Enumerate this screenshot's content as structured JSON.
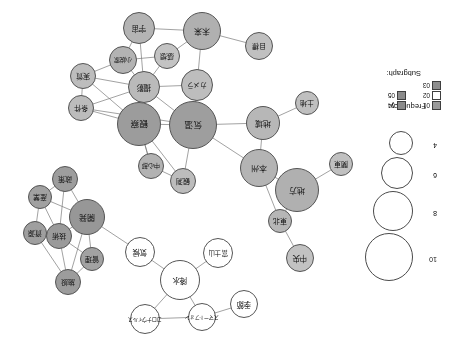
{
  "figure": {
    "type": "co-occurrence-network",
    "orientation_degrees": 180,
    "background": "#ffffff"
  },
  "legend": {
    "frequency": {
      "title": "Frequency:",
      "values": [
        4,
        6,
        8,
        10
      ],
      "radii_px": [
        11,
        15,
        19,
        23
      ]
    },
    "subgraph": {
      "title": "Subgraph:",
      "items": [
        {
          "id": "01",
          "color": "#9a9a9a"
        },
        {
          "id": "02",
          "color": "#ffffff"
        },
        {
          "id": "03",
          "color": "#8e8e8e"
        },
        {
          "id": "04",
          "color": "#8b8b8b"
        },
        {
          "id": "05",
          "color": "#8b8b8b"
        },
        {
          "id": "06",
          "color": "#9a9a9a"
        }
      ]
    }
  },
  "chart_data": {
    "type": "network",
    "title": "",
    "nodes": [
      {
        "id": "n_kisetsu",
        "label": "季節",
        "x": 211,
        "y": 49,
        "r": 14,
        "fill": "#ffffff",
        "font": 7.5
      },
      {
        "id": "n_smartphone",
        "label": "スマートフォン",
        "x": 253,
        "y": 36,
        "r": 14,
        "fill": "#ffffff",
        "font": 5.2
      },
      {
        "id": "n_coronavirus",
        "label": "コロナウイルス",
        "x": 310,
        "y": 34,
        "r": 15,
        "fill": "#ffffff",
        "font": 5.2
      },
      {
        "id": "n_kousui",
        "label": "降水",
        "x": 275,
        "y": 73,
        "r": 20,
        "fill": "#ffffff",
        "font": 7.5
      },
      {
        "id": "n_fuji",
        "label": "富士山",
        "x": 237,
        "y": 100,
        "r": 15,
        "fill": "#ffffff",
        "font": 6.5
      },
      {
        "id": "n_kikou",
        "label": "気候",
        "x": 315,
        "y": 101,
        "r": 15,
        "fill": "#ffffff",
        "font": 7.5
      },
      {
        "id": "n_chuuou",
        "label": "中央",
        "x": 155,
        "y": 95,
        "r": 14,
        "fill": "#c2c2c2",
        "font": 7.5
      },
      {
        "id": "n_touhoku",
        "label": "東北",
        "x": 175,
        "y": 132,
        "r": 12,
        "fill": "#b6b6b6",
        "font": 7
      },
      {
        "id": "n_chihou",
        "label": "地方",
        "x": 158,
        "y": 163,
        "r": 22,
        "fill": "#b0b0b0",
        "font": 8
      },
      {
        "id": "n_kanto",
        "label": "関東",
        "x": 114,
        "y": 189,
        "r": 12,
        "fill": "#c0c0c0",
        "font": 7
      },
      {
        "id": "n_honshu",
        "label": "本州",
        "x": 196,
        "y": 185,
        "r": 19,
        "fill": "#b4b4b4",
        "font": 8
      },
      {
        "id": "n_chiiki",
        "label": "地域",
        "x": 192,
        "y": 230,
        "r": 17,
        "fill": "#b7b7b7",
        "font": 8
      },
      {
        "id": "n_tochi",
        "label": "土地",
        "x": 148,
        "y": 250,
        "r": 12,
        "fill": "#bfbfbf",
        "font": 7
      },
      {
        "id": "n_kansoku",
        "label": "観測",
        "x": 272,
        "y": 172,
        "r": 13,
        "fill": "#bcbcbc",
        "font": 7
      },
      {
        "id": "n_chuushin",
        "label": "中心部",
        "x": 304,
        "y": 187,
        "r": 13,
        "fill": "#b2b2b2",
        "font": 6.2
      },
      {
        "id": "n_kion",
        "label": "気温",
        "x": 262,
        "y": 228,
        "r": 24,
        "fill": "#9e9e9e",
        "font": 8.5
      },
      {
        "id": "n_kansatsu",
        "label": "観察",
        "x": 316,
        "y": 229,
        "r": 22,
        "fill": "#9c9c9c",
        "font": 8.5
      },
      {
        "id": "n_kamera",
        "label": "カメラ",
        "x": 258,
        "y": 268,
        "r": 16,
        "fill": "#bdbdbd",
        "font": 6.8
      },
      {
        "id": "n_satsuei",
        "label": "撮影",
        "x": 311,
        "y": 266,
        "r": 16,
        "fill": "#bababa",
        "font": 7.5
      },
      {
        "id": "n_kansou",
        "label": "感想",
        "x": 288,
        "y": 297,
        "r": 13,
        "fill": "#c3c3c3",
        "font": 7
      },
      {
        "id": "n_shousetsu",
        "label": "小説家",
        "x": 332,
        "y": 293,
        "r": 14,
        "fill": "#b3b3b3",
        "font": 6.2
      },
      {
        "id": "n_jouken",
        "label": "条件",
        "x": 374,
        "y": 245,
        "r": 13,
        "fill": "#bcbcbc",
        "font": 7
      },
      {
        "id": "n_jisshitsu",
        "label": "実質",
        "x": 372,
        "y": 277,
        "r": 13,
        "fill": "#bdbdbd",
        "font": 7
      },
      {
        "id": "n_uchuu",
        "label": "宇宙",
        "x": 316,
        "y": 325,
        "r": 16,
        "fill": "#b4b4b4",
        "font": 7.5
      },
      {
        "id": "n_mirai",
        "label": "未来",
        "x": 253,
        "y": 322,
        "r": 19,
        "fill": "#b0b0b0",
        "font": 8
      },
      {
        "id": "n_mokuhyou",
        "label": "目標",
        "x": 196,
        "y": 307,
        "r": 14,
        "fill": "#c0c0c0",
        "font": 6.8
      },
      {
        "id": "n_shisetsu",
        "label": "施設",
        "x": 387,
        "y": 71,
        "r": 13,
        "fill": "#9c9c9c",
        "font": 7
      },
      {
        "id": "n_kanri",
        "label": "管理",
        "x": 363,
        "y": 94,
        "r": 12,
        "fill": "#a2a2a2",
        "font": 7
      },
      {
        "id": "n_gijutsu",
        "label": "技術",
        "x": 396,
        "y": 117,
        "r": 13,
        "fill": "#9a9a9a",
        "font": 7
      },
      {
        "id": "n_shigen",
        "label": "資源",
        "x": 420,
        "y": 120,
        "r": 12,
        "fill": "#9f9f9f",
        "font": 7
      },
      {
        "id": "n_kaihatsu",
        "label": "開発",
        "x": 368,
        "y": 136,
        "r": 18,
        "fill": "#979797",
        "font": 8
      },
      {
        "id": "n_sangyou",
        "label": "産業",
        "x": 415,
        "y": 156,
        "r": 12,
        "fill": "#a1a1a1",
        "font": 7
      },
      {
        "id": "n_seisaku",
        "label": "政策",
        "x": 390,
        "y": 174,
        "r": 13,
        "fill": "#9d9d9d",
        "font": 7
      }
    ],
    "edges": [
      [
        "n_kisetsu",
        "n_smartphone"
      ],
      [
        "n_smartphone",
        "n_coronavirus"
      ],
      [
        "n_smartphone",
        "n_kousui"
      ],
      [
        "n_coronavirus",
        "n_kousui"
      ],
      [
        "n_kousui",
        "n_fuji"
      ],
      [
        "n_kousui",
        "n_kikou"
      ],
      [
        "n_chuuou",
        "n_touhoku"
      ],
      [
        "n_touhoku",
        "n_chihou"
      ],
      [
        "n_touhoku",
        "n_honshu"
      ],
      [
        "n_chihou",
        "n_kanto"
      ],
      [
        "n_chihou",
        "n_honshu"
      ],
      [
        "n_honshu",
        "n_chiiki"
      ],
      [
        "n_chiiki",
        "n_tochi"
      ],
      [
        "n_chiiki",
        "n_kion"
      ],
      [
        "n_honshu",
        "n_kion"
      ],
      [
        "n_kansoku",
        "n_chuushin"
      ],
      [
        "n_kansoku",
        "n_kion"
      ],
      [
        "n_chuushin",
        "n_kansatsu"
      ],
      [
        "n_kansoku",
        "n_kansatsu"
      ],
      [
        "n_kion",
        "n_kansatsu"
      ],
      [
        "n_kion",
        "n_kamera"
      ],
      [
        "n_kion",
        "n_satsuei"
      ],
      [
        "n_kansatsu",
        "n_satsuei"
      ],
      [
        "n_kansatsu",
        "n_jouken"
      ],
      [
        "n_kansatsu",
        "n_jisshitsu"
      ],
      [
        "n_kamera",
        "n_satsuei"
      ],
      [
        "n_kamera",
        "n_mirai"
      ],
      [
        "n_satsuei",
        "n_kansou"
      ],
      [
        "n_satsuei",
        "n_shousetsu"
      ],
      [
        "n_satsuei",
        "n_jouken"
      ],
      [
        "n_satsuei",
        "n_jisshitsu"
      ],
      [
        "n_satsuei",
        "n_uchuu"
      ],
      [
        "n_shousetsu",
        "n_jisshitsu"
      ],
      [
        "n_shousetsu",
        "n_uchuu"
      ],
      [
        "n_kansou",
        "n_mirai"
      ],
      [
        "n_kansou",
        "n_shousetsu"
      ],
      [
        "n_mirai",
        "n_uchuu"
      ],
      [
        "n_mirai",
        "n_mokuhyou"
      ],
      [
        "n_jouken",
        "n_jisshitsu"
      ],
      [
        "n_shisetsu",
        "n_kanri"
      ],
      [
        "n_shisetsu",
        "n_gijutsu"
      ],
      [
        "n_shisetsu",
        "n_shigen"
      ],
      [
        "n_shisetsu",
        "n_kaihatsu"
      ],
      [
        "n_kanri",
        "n_gijutsu"
      ],
      [
        "n_kanri",
        "n_kaihatsu"
      ],
      [
        "n_gijutsu",
        "n_shigen"
      ],
      [
        "n_gijutsu",
        "n_kaihatsu"
      ],
      [
        "n_gijutsu",
        "n_sangyou"
      ],
      [
        "n_gijutsu",
        "n_seisaku"
      ],
      [
        "n_shigen",
        "n_sangyou"
      ],
      [
        "n_kaihatsu",
        "n_sangyou"
      ],
      [
        "n_kaihatsu",
        "n_seisaku"
      ],
      [
        "n_sangyou",
        "n_seisaku"
      ],
      [
        "n_kikou",
        "n_kaihatsu"
      ],
      [
        "n_kion",
        "n_jouken"
      ],
      [
        "n_kansatsu",
        "n_chuushin"
      ]
    ],
    "edge_color": "#7a7a7a",
    "legend_position": "left"
  }
}
